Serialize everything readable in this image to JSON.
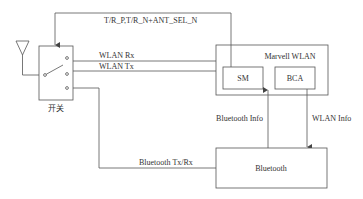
{
  "diagram": {
    "colors": {
      "line": "#555555",
      "text": "#333333",
      "background": "#ffffff"
    },
    "antenna": {
      "icon": "antenna-icon"
    },
    "switch": {
      "label": "开关",
      "icon": "switch-icon"
    },
    "signals": {
      "control": "T/R_P,T/R_N+ANT_SEL_N",
      "wlan_rx": "WLAN Rx",
      "wlan_tx": "WLAN Tx",
      "bt_txrx": "Bluetooth Tx/Rx",
      "bt_info": "Bluetooth Info",
      "wlan_info": "WLAN Info"
    },
    "blocks": {
      "marvell": {
        "label": "Marvell WLAN"
      },
      "sm": {
        "label": "SM"
      },
      "bca": {
        "label": "BCA"
      },
      "bluetooth": {
        "label": "Bluetooth"
      }
    }
  }
}
